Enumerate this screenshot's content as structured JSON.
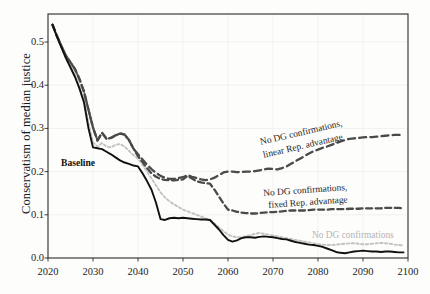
{
  "figure": {
    "background_color": "#fdfdfc",
    "plot_frame_color": "#2a2a2a"
  },
  "axes": {
    "y_axis_label": "Conservatism of median justice",
    "y_ticks": [
      "0.0",
      "0.1",
      "0.2",
      "0.3",
      "0.4",
      "0.5"
    ],
    "x_ticks": [
      "2020",
      "2030",
      "2040",
      "2050",
      "2060",
      "2070",
      "2080",
      "2090",
      "2100"
    ],
    "x_axis_label": ""
  },
  "annotations": {
    "baseline": "Baseline",
    "linear_line1": "No DG confirmations,",
    "linear_line2": "linear Rep. advantage",
    "fixed_line1": "No DG confirmations,",
    "fixed_line2": "fixed Rep. advantage",
    "nodg": "No DG confirmations"
  },
  "chart_data": {
    "type": "line",
    "title": "",
    "xlabel": "",
    "ylabel": "Conservatism of median justice",
    "xlim": [
      2020,
      2100
    ],
    "ylim": [
      0.0,
      0.55
    ],
    "grid": true,
    "legend_position": "inline-annotations",
    "x": [
      2021,
      2022,
      2023,
      2024,
      2025,
      2026,
      2027,
      2028,
      2029,
      2030,
      2031,
      2032,
      2033,
      2034,
      2035,
      2036,
      2037,
      2038,
      2039,
      2040,
      2041,
      2042,
      2043,
      2044,
      2045,
      2046,
      2047,
      2048,
      2049,
      2050,
      2051,
      2052,
      2053,
      2054,
      2055,
      2056,
      2057,
      2058,
      2059,
      2060,
      2061,
      2062,
      2063,
      2064,
      2065,
      2066,
      2067,
      2068,
      2069,
      2070,
      2071,
      2072,
      2073,
      2074,
      2075,
      2076,
      2077,
      2078,
      2079,
      2080,
      2081,
      2082,
      2083,
      2084,
      2085,
      2086,
      2087,
      2088,
      2089,
      2090,
      2091,
      2092,
      2093,
      2094,
      2095,
      2096,
      2097,
      2098,
      2099
    ],
    "series": [
      {
        "name": "Baseline",
        "color": "#111111",
        "style": "solid",
        "values": [
          0.54,
          0.512,
          0.487,
          0.462,
          0.441,
          0.419,
          0.392,
          0.36,
          0.3,
          0.256,
          0.254,
          0.252,
          0.246,
          0.24,
          0.233,
          0.226,
          0.221,
          0.218,
          0.214,
          0.212,
          0.196,
          0.178,
          0.158,
          0.128,
          0.09,
          0.088,
          0.092,
          0.093,
          0.092,
          0.093,
          0.092,
          0.091,
          0.09,
          0.089,
          0.089,
          0.088,
          0.077,
          0.066,
          0.053,
          0.042,
          0.038,
          0.041,
          0.046,
          0.048,
          0.048,
          0.047,
          0.049,
          0.05,
          0.049,
          0.048,
          0.046,
          0.044,
          0.043,
          0.04,
          0.037,
          0.035,
          0.033,
          0.031,
          0.03,
          0.028,
          0.026,
          0.022,
          0.018,
          0.014,
          0.012,
          0.011,
          0.013,
          0.015,
          0.016,
          0.017,
          0.016,
          0.015,
          0.015,
          0.014,
          0.015,
          0.015,
          0.014,
          0.013,
          0.013
        ]
      },
      {
        "name": "No DG confirmations, linear Rep. advantage",
        "color": "#4a4a4a",
        "style": "dashed-long",
        "values": [
          0.54,
          0.514,
          0.49,
          0.468,
          0.453,
          0.437,
          0.414,
          0.385,
          0.343,
          0.302,
          0.272,
          0.29,
          0.276,
          0.278,
          0.284,
          0.288,
          0.286,
          0.273,
          0.253,
          0.24,
          0.228,
          0.216,
          0.206,
          0.197,
          0.19,
          0.186,
          0.183,
          0.183,
          0.185,
          0.187,
          0.192,
          0.188,
          0.185,
          0.182,
          0.18,
          0.182,
          0.186,
          0.192,
          0.198,
          0.2,
          0.2,
          0.199,
          0.199,
          0.2,
          0.2,
          0.201,
          0.203,
          0.205,
          0.207,
          0.206,
          0.205,
          0.208,
          0.212,
          0.218,
          0.224,
          0.23,
          0.236,
          0.242,
          0.247,
          0.251,
          0.255,
          0.258,
          0.262,
          0.266,
          0.27,
          0.273,
          0.276,
          0.277,
          0.278,
          0.279,
          0.28,
          0.28,
          0.281,
          0.282,
          0.283,
          0.284,
          0.285,
          0.285,
          0.286
        ]
      },
      {
        "name": "No DG confirmations, fixed Rep. advantage",
        "color": "#4a4a4a",
        "style": "dashed",
        "values": [
          0.54,
          0.514,
          0.49,
          0.468,
          0.453,
          0.437,
          0.414,
          0.385,
          0.343,
          0.302,
          0.272,
          0.29,
          0.276,
          0.278,
          0.284,
          0.288,
          0.286,
          0.273,
          0.253,
          0.236,
          0.222,
          0.208,
          0.196,
          0.188,
          0.183,
          0.181,
          0.18,
          0.18,
          0.181,
          0.182,
          0.19,
          0.184,
          0.178,
          0.175,
          0.173,
          0.172,
          0.158,
          0.142,
          0.126,
          0.112,
          0.11,
          0.107,
          0.105,
          0.104,
          0.103,
          0.103,
          0.104,
          0.105,
          0.106,
          0.106,
          0.107,
          0.108,
          0.109,
          0.11,
          0.11,
          0.11,
          0.11,
          0.111,
          0.112,
          0.112,
          0.112,
          0.112,
          0.113,
          0.113,
          0.113,
          0.113,
          0.114,
          0.114,
          0.114,
          0.115,
          0.115,
          0.115,
          0.115,
          0.115,
          0.116,
          0.116,
          0.116,
          0.116,
          0.115
        ]
      },
      {
        "name": "No DG confirmations",
        "color": "#c2c2c2",
        "style": "dotted",
        "values": [
          0.54,
          0.512,
          0.487,
          0.463,
          0.444,
          0.424,
          0.398,
          0.367,
          0.312,
          0.268,
          0.258,
          0.266,
          0.258,
          0.256,
          0.262,
          0.264,
          0.258,
          0.248,
          0.238,
          0.23,
          0.216,
          0.2,
          0.184,
          0.168,
          0.152,
          0.14,
          0.131,
          0.124,
          0.118,
          0.112,
          0.108,
          0.104,
          0.1,
          0.096,
          0.092,
          0.088,
          0.08,
          0.071,
          0.062,
          0.054,
          0.05,
          0.048,
          0.048,
          0.05,
          0.053,
          0.056,
          0.058,
          0.056,
          0.054,
          0.052,
          0.05,
          0.048,
          0.046,
          0.044,
          0.042,
          0.04,
          0.038,
          0.036,
          0.034,
          0.032,
          0.031,
          0.03,
          0.03,
          0.031,
          0.032,
          0.033,
          0.034,
          0.034,
          0.033,
          0.032,
          0.032,
          0.033,
          0.034,
          0.035,
          0.034,
          0.033,
          0.031,
          0.03,
          0.029
        ]
      }
    ]
  }
}
